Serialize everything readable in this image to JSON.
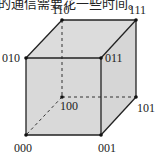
{
  "caption": "的通信需要花一些时间。",
  "cube": {
    "fill_color": "#d9d9d9",
    "edge_color": "#222222",
    "vertices": [
      {
        "label": "000",
        "x": 26,
        "y": 135
      },
      {
        "label": "001",
        "x": 101,
        "y": 135
      },
      {
        "label": "010",
        "x": 26,
        "y": 58
      },
      {
        "label": "011",
        "x": 101,
        "y": 58
      },
      {
        "label": "100",
        "x": 62,
        "y": 97
      },
      {
        "label": "101",
        "x": 136,
        "y": 97
      },
      {
        "label": "110",
        "x": 62,
        "y": 20
      },
      {
        "label": "111",
        "x": 136,
        "y": 20
      }
    ],
    "labels": {
      "v000": "000",
      "v001": "001",
      "v010": "010",
      "v011": "011",
      "v100": "100",
      "v101": "101",
      "v110": "110",
      "v111": "111"
    }
  }
}
